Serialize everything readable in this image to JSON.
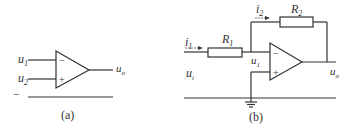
{
  "panel_a": {
    "caption": "(a)",
    "inputs": [
      {
        "label": "u",
        "sub": "1",
        "pin": "−"
      },
      {
        "label": "u",
        "sub": "2",
        "pin": "+"
      }
    ],
    "output": {
      "label": "u",
      "sub": "o"
    },
    "ground_mark": "−"
  },
  "panel_b": {
    "caption": "(b)",
    "current_in": {
      "label": "i",
      "sub": "1"
    },
    "current_fb": {
      "label": "i",
      "sub": "2"
    },
    "r1": {
      "label": "R",
      "sub": "1"
    },
    "r2": {
      "label": "R",
      "sub": "2"
    },
    "node": {
      "label": "u",
      "sub": "1"
    },
    "input": {
      "label": "u",
      "sub": "i"
    },
    "output": {
      "label": "u",
      "sub": "o"
    },
    "minus_pin": "−",
    "plus_pin": "+"
  },
  "colors": {
    "stroke": "#333333",
    "background": "#ffffff"
  }
}
